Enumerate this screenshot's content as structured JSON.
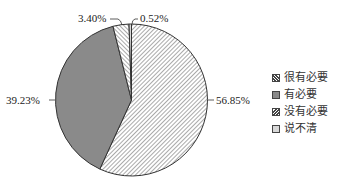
{
  "chart_data": {
    "type": "pie",
    "title": "",
    "start_angle": "12 o'clock",
    "direction": "clockwise",
    "categories": [
      "很有必要",
      "有必要",
      "没有必要",
      "说不清"
    ],
    "values": [
      56.85,
      39.23,
      3.4,
      0.52
    ],
    "labels": [
      "56.85%",
      "39.23%",
      "3.40%",
      "0.52%"
    ],
    "fills": [
      "hatch-backslash",
      "solid-gray",
      "hatch-slash",
      "light-gray"
    ],
    "colors": [
      "#ffffff",
      "#8a8a8a",
      "#ffffff",
      "#d8d8d8"
    ],
    "legend_position": "right"
  },
  "legend": {
    "items": [
      {
        "label": "很有必要"
      },
      {
        "label": "有必要"
      },
      {
        "label": "没有必要"
      },
      {
        "label": "说不清"
      }
    ]
  }
}
